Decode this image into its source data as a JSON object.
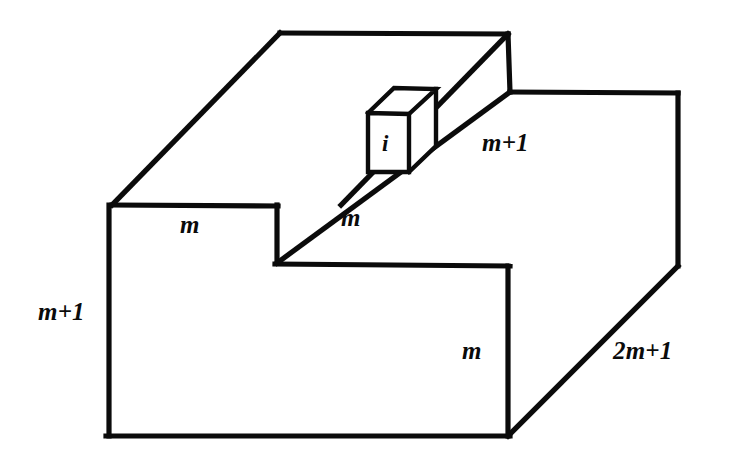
{
  "figure": {
    "kind": "3d-block-diagram",
    "background_color": "#ffffff",
    "line_color": "#0b0b0b",
    "labels": {
      "left_height": "m+1",
      "top_front_depth": "m",
      "step_depth": "m",
      "upper_right_height": "m+1",
      "front_right_height": "m",
      "bottom_right_width": "2m+1",
      "unit_cube": "i"
    },
    "dimensions": {
      "left_height_value": "m+1",
      "top_front_depth_value": "m",
      "step_depth_value": "m",
      "upper_right_height_value": "m+1",
      "front_right_height_value": "m",
      "bottom_right_width_value": "2m+1"
    }
  }
}
